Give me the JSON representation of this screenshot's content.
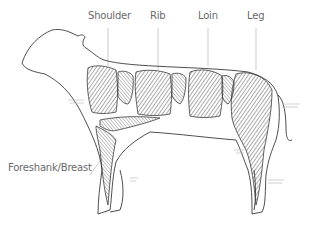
{
  "diagram": {
    "labels": {
      "shoulder": "Shoulder",
      "rib": "Rib",
      "loin": "Loin",
      "leg": "Leg",
      "foreshank_breast": "Foreshank/Breast"
    },
    "colors": {
      "outline": "#3a3a3a",
      "hatch": "#555555",
      "label": "#6a6a6a",
      "leader": "#bdbdbd"
    }
  }
}
